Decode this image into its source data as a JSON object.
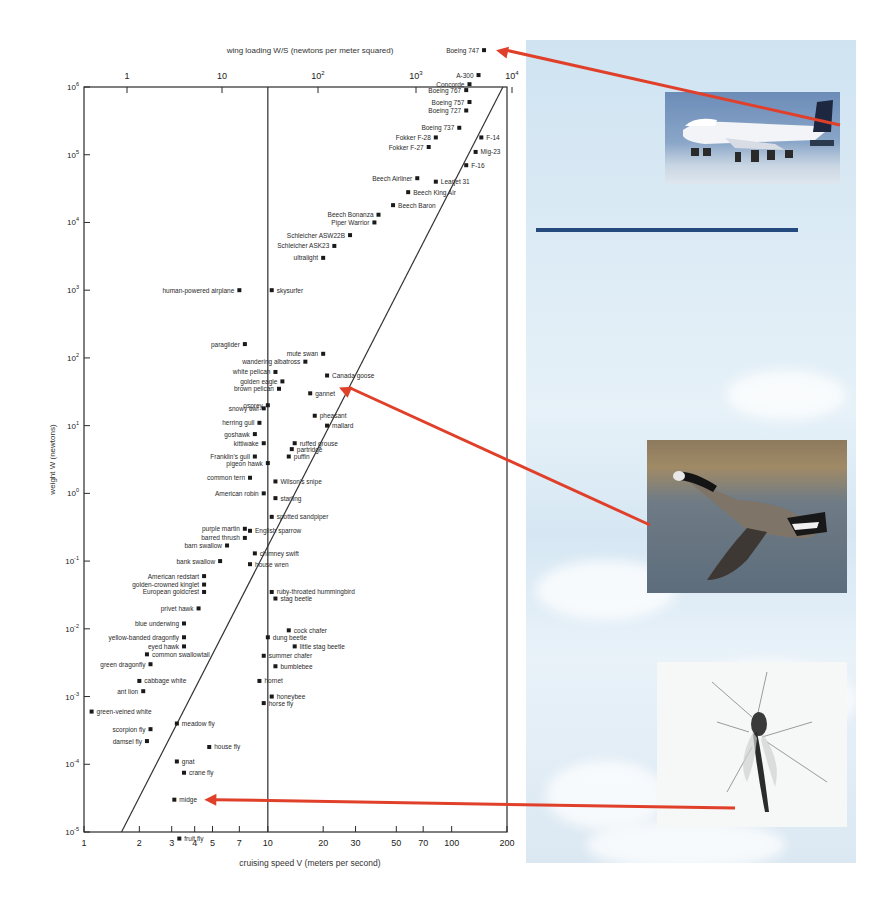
{
  "chart_data": {
    "type": "scatter",
    "title": "",
    "xlabel": "cruising speed V (meters per second)",
    "ylabel": "weight W (newtons)",
    "top_axis_label": "wing loading W/S (newtons per meter squared)",
    "xscale": "log",
    "yscale": "log",
    "xlim": [
      1,
      200
    ],
    "ylim": [
      1e-05,
      1000000
    ],
    "grid": false,
    "legend": null,
    "x_ticks": [
      "1",
      "2",
      "3",
      "4",
      "5",
      "7",
      "10",
      "20",
      "30",
      "50",
      "70",
      "100",
      "200"
    ],
    "y_ticks": [
      "10^6",
      "10^5",
      "10^4",
      "10^3",
      "10^2",
      "10^1",
      "10^0",
      "10^-1",
      "10^-2",
      "10^-3",
      "10^-4",
      "10^-5"
    ],
    "top_ticks": [
      "1",
      "10",
      "10^2",
      "10^3",
      "10^4"
    ],
    "reference_line_x": 10,
    "trend_line": {
      "from": [
        1.6,
        1e-05
      ],
      "to": [
        190,
        1000000
      ]
    },
    "points": [
      {
        "label": "Boeing 747",
        "v": 150,
        "w": 3500000,
        "side": "left"
      },
      {
        "label": "A-300",
        "v": 140,
        "w": 1500000,
        "side": "left"
      },
      {
        "label": "Concorde",
        "v": 125,
        "w": 1100000,
        "side": "left"
      },
      {
        "label": "Boeing 767",
        "v": 120,
        "w": 900000,
        "side": "left"
      },
      {
        "label": "Boeing 757",
        "v": 125,
        "w": 600000,
        "side": "left"
      },
      {
        "label": "Boeing 727",
        "v": 120,
        "w": 450000,
        "side": "left"
      },
      {
        "label": "Boeing 737",
        "v": 110,
        "w": 250000,
        "side": "left"
      },
      {
        "label": "F-14",
        "v": 145,
        "w": 180000,
        "side": "right"
      },
      {
        "label": "Fokker F-28",
        "v": 82,
        "w": 180000,
        "side": "left"
      },
      {
        "label": "Fokker F-27",
        "v": 75,
        "w": 130000,
        "side": "left"
      },
      {
        "label": "Mig-23",
        "v": 135,
        "w": 110000,
        "side": "right"
      },
      {
        "label": "F-16",
        "v": 120,
        "w": 70000,
        "side": "right"
      },
      {
        "label": "Beech Airliner",
        "v": 65,
        "w": 45000,
        "side": "left"
      },
      {
        "label": "Learjet 31",
        "v": 82,
        "w": 40000,
        "side": "right"
      },
      {
        "label": "Beech King Air",
        "v": 58,
        "w": 28000,
        "side": "right"
      },
      {
        "label": "Beech Baron",
        "v": 48,
        "w": 18000,
        "side": "right"
      },
      {
        "label": "Beech Bonanza",
        "v": 40,
        "w": 13000,
        "side": "left"
      },
      {
        "label": "Piper Warrior",
        "v": 38,
        "w": 10000,
        "side": "left"
      },
      {
        "label": "Schleicher ASW22B",
        "v": 28,
        "w": 6500,
        "side": "left"
      },
      {
        "label": "Schleicher ASK23",
        "v": 23,
        "w": 4500,
        "side": "left"
      },
      {
        "label": "ultralight",
        "v": 20,
        "w": 3000,
        "side": "left"
      },
      {
        "label": "human-powered airplane",
        "v": 7,
        "w": 1000,
        "side": "left"
      },
      {
        "label": "skysurfer",
        "v": 10.5,
        "w": 1000,
        "side": "right"
      },
      {
        "label": "paraglider",
        "v": 7.5,
        "w": 160,
        "side": "left"
      },
      {
        "label": "mute swan",
        "v": 20,
        "w": 115,
        "side": "left"
      },
      {
        "label": "wandering albatross",
        "v": 16,
        "w": 88,
        "side": "left"
      },
      {
        "label": "Canada goose",
        "v": 21,
        "w": 55,
        "side": "right"
      },
      {
        "label": "white pelican",
        "v": 11,
        "w": 62,
        "side": "left"
      },
      {
        "label": "golden eagle",
        "v": 12,
        "w": 45,
        "side": "left"
      },
      {
        "label": "brown pelican",
        "v": 11.5,
        "w": 35,
        "side": "left"
      },
      {
        "label": "gannet",
        "v": 17,
        "w": 30,
        "side": "right"
      },
      {
        "label": "osprey",
        "v": 10,
        "w": 20,
        "side": "left"
      },
      {
        "label": "pheasant",
        "v": 18,
        "w": 14,
        "side": "right"
      },
      {
        "label": "snowy owl",
        "v": 9.5,
        "w": 18,
        "side": "left"
      },
      {
        "label": "herring gull",
        "v": 9,
        "w": 11,
        "side": "left"
      },
      {
        "label": "mallard",
        "v": 21,
        "w": 10,
        "side": "right"
      },
      {
        "label": "goshawk",
        "v": 8.5,
        "w": 7.5,
        "side": "left"
      },
      {
        "label": "kittiwake",
        "v": 9.5,
        "w": 5.5,
        "side": "left"
      },
      {
        "label": "ruffed grouse",
        "v": 14,
        "w": 5.5,
        "side": "right"
      },
      {
        "label": "Franklin's gull",
        "v": 8.5,
        "w": 3.5,
        "side": "left"
      },
      {
        "label": "partridge",
        "v": 13.5,
        "w": 4.5,
        "side": "right"
      },
      {
        "label": "pigeon hawk",
        "v": 10,
        "w": 2.8,
        "side": "left"
      },
      {
        "label": "puffin",
        "v": 13,
        "w": 3.5,
        "side": "right"
      },
      {
        "label": "common tern",
        "v": 8,
        "w": 1.7,
        "side": "left"
      },
      {
        "label": "American robin",
        "v": 9.5,
        "w": 1.0,
        "side": "left"
      },
      {
        "label": "Wilson's snipe",
        "v": 11,
        "w": 1.5,
        "side": "right"
      },
      {
        "label": "starling",
        "v": 11,
        "w": 0.85,
        "side": "right"
      },
      {
        "label": "spotted sandpiper",
        "v": 10.5,
        "w": 0.45,
        "side": "right"
      },
      {
        "label": "purple martin",
        "v": 7.5,
        "w": 0.3,
        "side": "left"
      },
      {
        "label": "barred thrush",
        "v": 7.5,
        "w": 0.22,
        "side": "left"
      },
      {
        "label": "barn swallow",
        "v": 6,
        "w": 0.17,
        "side": "left"
      },
      {
        "label": "English sparrow",
        "v": 8,
        "w": 0.28,
        "side": "right"
      },
      {
        "label": "bank swallow",
        "v": 5.5,
        "w": 0.1,
        "side": "left"
      },
      {
        "label": "chimney swift",
        "v": 8.5,
        "w": 0.13,
        "side": "right"
      },
      {
        "label": "house wren",
        "v": 8,
        "w": 0.09,
        "side": "right"
      },
      {
        "label": "American redstart",
        "v": 4.5,
        "w": 0.06,
        "side": "left"
      },
      {
        "label": "golden-crowned kinglet",
        "v": 4.5,
        "w": 0.045,
        "side": "left"
      },
      {
        "label": "European goldcrest",
        "v": 4.5,
        "w": 0.035,
        "side": "left"
      },
      {
        "label": "ruby-throated hummingbird",
        "v": 10.5,
        "w": 0.035,
        "side": "right"
      },
      {
        "label": "stag beetle",
        "v": 11,
        "w": 0.028,
        "side": "right"
      },
      {
        "label": "privet hawk",
        "v": 4.2,
        "w": 0.02,
        "side": "left"
      },
      {
        "label": "blue underwing",
        "v": 3.5,
        "w": 0.012,
        "side": "left"
      },
      {
        "label": "cock chafer",
        "v": 13,
        "w": 0.0095,
        "side": "right"
      },
      {
        "label": "yellow-banded dragonfly",
        "v": 3.5,
        "w": 0.0075,
        "side": "left"
      },
      {
        "label": "dung beetle",
        "v": 10,
        "w": 0.0075,
        "side": "right"
      },
      {
        "label": "eyed hawk",
        "v": 3.5,
        "w": 0.0055,
        "side": "left"
      },
      {
        "label": "little stag beetle",
        "v": 14,
        "w": 0.0055,
        "side": "right"
      },
      {
        "label": "common swallowtail",
        "v": 2.2,
        "w": 0.0042,
        "side": "right"
      },
      {
        "label": "summer chafer",
        "v": 9.5,
        "w": 0.004,
        "side": "right"
      },
      {
        "label": "green dragonfly",
        "v": 2.3,
        "w": 0.003,
        "side": "left"
      },
      {
        "label": "bumblebee",
        "v": 11,
        "w": 0.0028,
        "side": "right"
      },
      {
        "label": "cabbage white",
        "v": 2,
        "w": 0.0017,
        "side": "right"
      },
      {
        "label": "hornet",
        "v": 9,
        "w": 0.0017,
        "side": "right"
      },
      {
        "label": "ant lion",
        "v": 2.1,
        "w": 0.0012,
        "side": "left"
      },
      {
        "label": "honeybee",
        "v": 10.5,
        "w": 0.001,
        "side": "right"
      },
      {
        "label": "horse fly",
        "v": 9.5,
        "w": 0.0008,
        "side": "right"
      },
      {
        "label": "green-veined white",
        "v": 1.1,
        "w": 0.0006,
        "side": "right"
      },
      {
        "label": "meadow fly",
        "v": 3.2,
        "w": 0.0004,
        "side": "right"
      },
      {
        "label": "scorpion fly",
        "v": 2.3,
        "w": 0.00033,
        "side": "left"
      },
      {
        "label": "damsel fly",
        "v": 2.2,
        "w": 0.00022,
        "side": "left"
      },
      {
        "label": "house fly",
        "v": 4.8,
        "w": 0.00018,
        "side": "right"
      },
      {
        "label": "gnat",
        "v": 3.2,
        "w": 0.00011,
        "side": "right"
      },
      {
        "label": "crane fly",
        "v": 3.5,
        "w": 7.5e-05,
        "side": "right"
      },
      {
        "label": "midge",
        "v": 3.1,
        "w": 3e-05,
        "side": "right"
      },
      {
        "label": "fruit fly",
        "v": 3.3,
        "w": 8e-06,
        "side": "right"
      }
    ]
  },
  "annotations": {
    "arrows": [
      {
        "name": "airplane-arrow",
        "target": "Boeing 747",
        "color": "#e0402a"
      },
      {
        "name": "goose-arrow",
        "target": "Canada goose",
        "color": "#e0402a"
      },
      {
        "name": "midge-arrow",
        "target": "midge",
        "color": "#e0402a"
      }
    ],
    "photos": [
      {
        "name": "boeing-747-photo",
        "subject": "airliner in flight"
      },
      {
        "name": "canada-goose-photo",
        "subject": "Canada goose in flight"
      },
      {
        "name": "midge-photo",
        "subject": "midge insect"
      }
    ]
  },
  "colors": {
    "axis": "#2b2b2b",
    "marker": "#1a1a1a",
    "arrow": "#e0402a",
    "panel_sky": "#dbe9f4",
    "rule": "#254a7d"
  }
}
